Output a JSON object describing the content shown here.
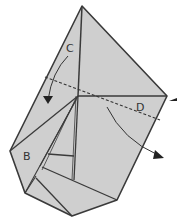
{
  "diagram": {
    "type": "origami-fold-step",
    "labels": {
      "c": "C",
      "d": "D",
      "b": "B"
    },
    "colors": {
      "paper": "#cfcfcf",
      "outline": "#3a3a3a",
      "background": "#ffffff"
    },
    "annotations": [
      {
        "kind": "valley-fold-line",
        "description": "dashed line across the model"
      },
      {
        "kind": "fold-arrow",
        "target": "C",
        "direction": "down"
      },
      {
        "kind": "fold-arrow",
        "target": "D",
        "direction": "down-right"
      },
      {
        "kind": "pointer-arrow",
        "position": "right edge"
      }
    ]
  }
}
